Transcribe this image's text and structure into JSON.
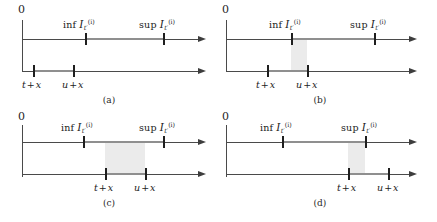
{
  "figure": {
    "zero_label": "0",
    "math": {
      "inf_op": "inf",
      "sup_op": "sup",
      "script_letter": "I",
      "subscript": "t′",
      "superscript": "(i)",
      "t_shift_var": "t",
      "u_shift_var": "u",
      "plus": "+",
      "shift_var": "x"
    },
    "colors": {
      "axis": "#4a4a4a",
      "tick": "#1f1f1f",
      "segment": "#8f8f8f",
      "shade": "#ebebeb",
      "text": "#1c1c1c",
      "background": "#ffffff"
    },
    "panels": [
      {
        "id": "a",
        "caption": "(a)",
        "top_axis": {
          "inf_label": "inf",
          "sup_label": "sup",
          "inf_pos": 85,
          "sup_pos": 163
        },
        "bottom_axis": {
          "left_label": "t + x",
          "right_label": "u + x",
          "left_pos": 33,
          "right_pos": 73
        },
        "overlap": "none",
        "shade_from": 0,
        "shade_to": 0
      },
      {
        "id": "b",
        "caption": "(b)",
        "top_axis": {
          "inf_label": "inf",
          "sup_label": "sup",
          "inf_pos": 72,
          "sup_pos": 155
        },
        "bottom_axis": {
          "left_label": "t + x",
          "right_label": "u + x",
          "left_pos": 48,
          "right_pos": 88
        },
        "overlap": "left-partial",
        "shade_from": 72,
        "shade_to": 88
      },
      {
        "id": "c",
        "caption": "(c)",
        "top_axis": {
          "inf_label": "inf",
          "sup_label": "sup",
          "inf_pos": 83,
          "sup_pos": 163
        },
        "bottom_axis": {
          "left_label": "t + x",
          "right_label": "u + x",
          "left_pos": 105,
          "right_pos": 145
        },
        "overlap": "contained",
        "shade_from": 105,
        "shade_to": 145
      },
      {
        "id": "d",
        "caption": "(d)",
        "top_axis": {
          "inf_label": "inf",
          "sup_label": "sup",
          "inf_pos": 63,
          "sup_pos": 146
        },
        "bottom_axis": {
          "left_label": "t + x",
          "right_label": "u + x",
          "left_pos": 129,
          "right_pos": 169
        },
        "overlap": "right-partial",
        "shade_from": 129,
        "shade_to": 146
      }
    ]
  }
}
